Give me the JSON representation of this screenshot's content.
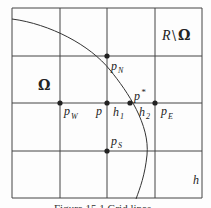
{
  "diagram": {
    "grid": {
      "x_lines": [
        12,
        60,
        107,
        155,
        202
      ],
      "y_lines": [
        8,
        56,
        103,
        151,
        198
      ],
      "stroke": "#444444"
    },
    "boundary_curve": {
      "path": "M12,19 C50,24 90,45 110,70 C128,92 150,125 147,155 C145,175 140,188 136,199",
      "stroke": "#333333"
    },
    "points": [
      {
        "id": "p_N",
        "x": 107,
        "y": 56,
        "label": "p",
        "sub": "N"
      },
      {
        "id": "p_W",
        "x": 60,
        "y": 103,
        "label": "p",
        "sub": "W"
      },
      {
        "id": "p",
        "x": 107,
        "y": 103,
        "label": "p",
        "sub": ""
      },
      {
        "id": "p_star",
        "x": 130,
        "y": 103,
        "label": "p*",
        "sub": ""
      },
      {
        "id": "p_E",
        "x": 155,
        "y": 103,
        "label": "p",
        "sub": "E"
      },
      {
        "id": "p_S",
        "x": 107,
        "y": 151,
        "label": "p",
        "sub": "S"
      }
    ],
    "labels": {
      "omega": "Ω",
      "complement_R": "R",
      "complement_sep": "\\",
      "complement_omega": "Ω",
      "p": "p",
      "N": "N",
      "W": "W",
      "E": "E",
      "S": "S",
      "p_star": "p",
      "star": "*",
      "h1": "h",
      "h1_sub": "1",
      "h2": "h",
      "h2_sub": "2",
      "h": "h"
    },
    "caption": "Figure 15.1 Grid lines"
  }
}
